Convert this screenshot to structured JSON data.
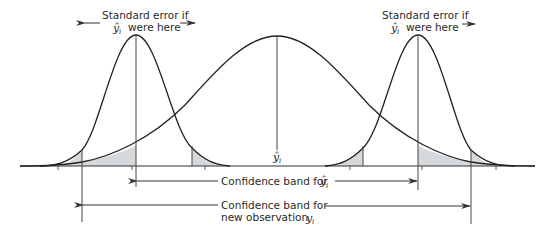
{
  "diagram": {
    "colors": {
      "curve": "#222222",
      "axis": "#333333",
      "shade": "#d6d9dc",
      "text": "#2a2a2a"
    },
    "labels": {
      "left_se_line1": "Standard error if",
      "left_se_line2": "were here",
      "right_se_line1": "Standard error if",
      "right_se_line2": "were here",
      "yhat": "ŷ",
      "yhat_sub": "i",
      "center_yhat": "ŷ",
      "center_yhat_sub": "i",
      "band_yhat": "Confidence band for",
      "band_yhat_symbol": "ŷ",
      "band_yhat_sub": "i",
      "band_new_line1": "Confidence band for",
      "band_new_line2": "new observation",
      "band_new_symbol": "y",
      "band_new_sub": "i"
    },
    "elements": [
      "wide normal curve centered at ŷ_i",
      "narrow normal curve (standard error) at lower confidence limit",
      "narrow normal curve (standard error) at upper confidence limit",
      "shaded tail areas",
      "confidence band for ŷ_i (double arrow)",
      "confidence band for new observation y_i (double arrow)"
    ]
  }
}
